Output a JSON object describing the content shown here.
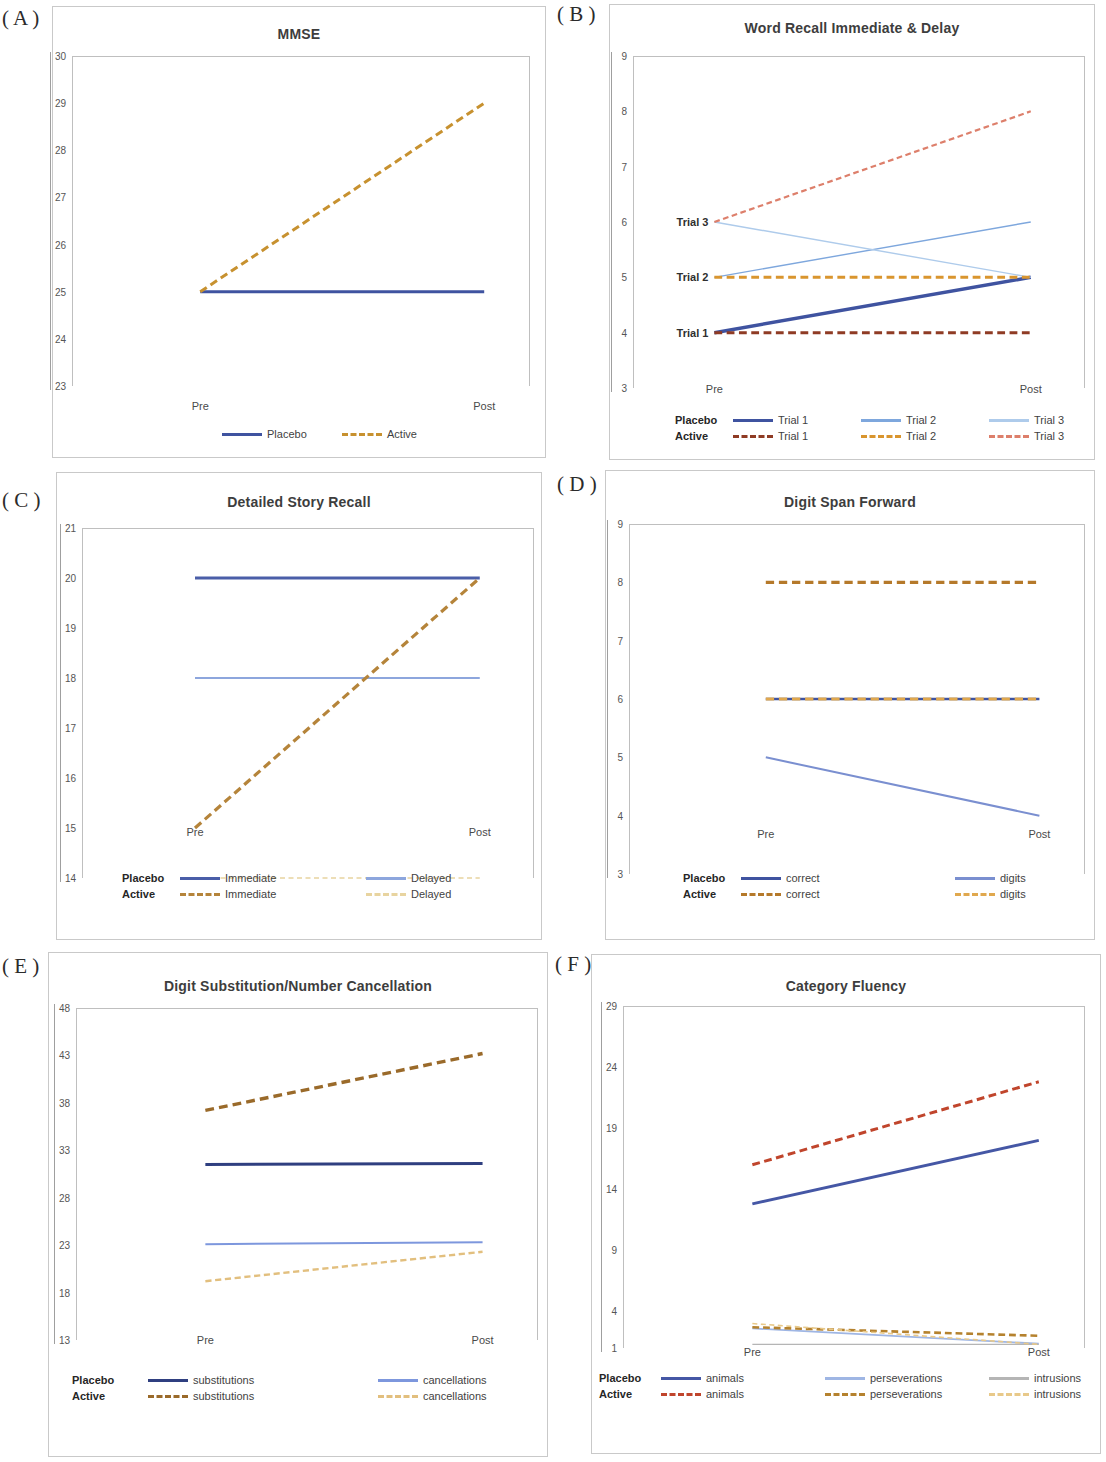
{
  "figure": {
    "panel_letters": [
      "( A )",
      "( B )",
      "( C )",
      "( D )",
      "( E )",
      "( F )"
    ],
    "x_categories": [
      "Pre",
      "Post"
    ],
    "group_labels": [
      "Placebo",
      "Active"
    ]
  },
  "colors": {
    "placebo_dark_blue": "#3f53a0",
    "placebo_mid_blue": "#6f8fd0",
    "placebo_light_blue": "#a9c4e8",
    "active_orange": "#c7912f",
    "active_dark_red": "#8f3b24",
    "active_light_orange": "#e0bb74",
    "active_red": "#c0452c",
    "frame_grey": "#c9c9c9",
    "axis_grey": "#9f9f9f"
  },
  "chart_data": [
    {
      "panel": "A",
      "type": "line",
      "title": "MMSE",
      "xlabel": "",
      "ylabel": "",
      "categories": [
        "Pre",
        "Post"
      ],
      "ylim": [
        23,
        30
      ],
      "yticks": [
        30,
        29,
        28,
        27,
        26,
        25,
        24,
        23
      ],
      "grid": false,
      "legend_position": "bottom",
      "series": [
        {
          "name": "Placebo",
          "group": "Placebo",
          "values": [
            25,
            25
          ],
          "color": "#3f53a0",
          "style": "solid",
          "width": 3
        },
        {
          "name": "Active",
          "group": "Active",
          "values": [
            25,
            29
          ],
          "color": "#c7912f",
          "style": "dashed",
          "width": 3
        }
      ],
      "legend": [
        {
          "group": "",
          "items": [
            {
              "label": "Placebo",
              "color": "#3f53a0",
              "style": "solid"
            },
            {
              "label": "Active",
              "color": "#c7912f",
              "style": "dashed"
            }
          ]
        }
      ]
    },
    {
      "panel": "B",
      "type": "line",
      "title": "Word Recall Immediate & Delay",
      "xlabel": "",
      "ylabel": "",
      "categories": [
        "Pre",
        "Post"
      ],
      "ylim": [
        3,
        9
      ],
      "yticks": [
        9,
        8,
        7,
        6,
        5,
        4,
        3
      ],
      "grid": false,
      "legend_position": "bottom",
      "annotations": [
        "Trial 3",
        "Trial 2",
        "Trial 1"
      ],
      "annotation_values": [
        6,
        5,
        4
      ],
      "series": [
        {
          "name": "Trial 1",
          "group": "Placebo",
          "values": [
            4,
            5
          ],
          "color": "#3f53a0",
          "style": "solid",
          "width": 3.5
        },
        {
          "name": "Trial 2",
          "group": "Placebo",
          "values": [
            5,
            6
          ],
          "color": "#7ea7dd",
          "style": "solid",
          "width": 1.4
        },
        {
          "name": "Trial 3",
          "group": "Placebo",
          "values": [
            6,
            5
          ],
          "color": "#aecbeb",
          "style": "solid",
          "width": 1.4
        },
        {
          "name": "Trial 1",
          "group": "Active",
          "values": [
            4,
            4
          ],
          "color": "#8f3b24",
          "style": "dashed",
          "width": 3
        },
        {
          "name": "Trial 2",
          "group": "Active",
          "values": [
            5,
            5
          ],
          "color": "#d9952e",
          "style": "dashed",
          "width": 3
        },
        {
          "name": "Trial 3",
          "group": "Active",
          "values": [
            6,
            8
          ],
          "color": "#dd7f6b",
          "style": "dashed",
          "width": 2.2
        }
      ],
      "legend": [
        {
          "group": "Placebo",
          "items": [
            {
              "label": "Trial 1",
              "color": "#3f53a0",
              "style": "solid"
            },
            {
              "label": "Trial 2",
              "color": "#7ea7dd",
              "style": "solid"
            },
            {
              "label": "Trial 3",
              "color": "#aecbeb",
              "style": "solid"
            }
          ]
        },
        {
          "group": "Active",
          "items": [
            {
              "label": "Trial 1",
              "color": "#8f3b24",
              "style": "dashed"
            },
            {
              "label": "Trial 2",
              "color": "#d9952e",
              "style": "dashed"
            },
            {
              "label": "Trial 3",
              "color": "#dd7f6b",
              "style": "dashed"
            }
          ]
        }
      ]
    },
    {
      "panel": "C",
      "type": "line",
      "title": "Detailed Story Recall",
      "xlabel": "",
      "ylabel": "",
      "categories": [
        "Pre",
        "Post"
      ],
      "ylim": [
        14,
        21
      ],
      "yticks": [
        21,
        20,
        19,
        18,
        17,
        16,
        15,
        14
      ],
      "grid": false,
      "legend_position": "bottom",
      "series": [
        {
          "name": "Immediate",
          "group": "Placebo",
          "values": [
            20,
            20
          ],
          "color": "#4a5ea8",
          "style": "solid",
          "width": 3.2
        },
        {
          "name": "Delayed",
          "group": "Placebo",
          "values": [
            18,
            18
          ],
          "color": "#8da6dd",
          "style": "solid",
          "width": 2
        },
        {
          "name": "Immediate",
          "group": "Active",
          "values": [
            15,
            20
          ],
          "color": "#b5843a",
          "style": "dashed",
          "width": 3.2
        },
        {
          "name": "Delayed",
          "group": "Active",
          "values": [
            14,
            14
          ],
          "color": "#e8d4a0",
          "style": "dashed",
          "width": 1.5
        }
      ],
      "legend": [
        {
          "group": "Placebo",
          "items": [
            {
              "label": "Immediate",
              "color": "#4a5ea8",
              "style": "solid"
            },
            {
              "label": "Delayed",
              "color": "#8da6dd",
              "style": "solid"
            }
          ]
        },
        {
          "group": "Active",
          "items": [
            {
              "label": "Immediate",
              "color": "#b5843a",
              "style": "dashed"
            },
            {
              "label": "Delayed",
              "color": "#e8d4a0",
              "style": "dashed"
            }
          ]
        }
      ]
    },
    {
      "panel": "D",
      "type": "line",
      "title": "Digit Span Forward",
      "xlabel": "",
      "ylabel": "",
      "categories": [
        "Pre",
        "Post"
      ],
      "ylim": [
        3,
        9
      ],
      "yticks": [
        9,
        8,
        7,
        6,
        5,
        4,
        3
      ],
      "grid": false,
      "legend_position": "bottom",
      "series": [
        {
          "name": "correct",
          "group": "Placebo",
          "values": [
            6,
            6
          ],
          "color": "#3f53a0",
          "style": "solid",
          "width": 2.6
        },
        {
          "name": "digits",
          "group": "Placebo",
          "values": [
            5,
            4
          ],
          "color": "#7a8fd0",
          "style": "solid",
          "width": 2
        },
        {
          "name": "correct",
          "group": "Active",
          "values": [
            8,
            8
          ],
          "color": "#b5792a",
          "style": "dashed",
          "width": 3.2
        },
        {
          "name": "digits",
          "group": "Active",
          "values": [
            6,
            6
          ],
          "color": "#e0a84e",
          "style": "dashed",
          "width": 3.2
        }
      ],
      "legend": [
        {
          "group": "Placebo",
          "items": [
            {
              "label": "correct",
              "color": "#3f53a0",
              "style": "solid"
            },
            {
              "label": "digits",
              "color": "#7a8fd0",
              "style": "solid"
            }
          ]
        },
        {
          "group": "Active",
          "items": [
            {
              "label": "correct",
              "color": "#b5792a",
              "style": "dashed"
            },
            {
              "label": "digits",
              "color": "#e0a84e",
              "style": "dashed"
            }
          ]
        }
      ]
    },
    {
      "panel": "E",
      "type": "line",
      "title": "Digit Substitution/Number Cancellation",
      "xlabel": "",
      "ylabel": "",
      "categories": [
        "Pre",
        "Post"
      ],
      "ylim": [
        13,
        48
      ],
      "yticks": [
        48,
        43,
        38,
        33,
        28,
        23,
        18,
        13
      ],
      "grid": false,
      "legend_position": "bottom",
      "series": [
        {
          "name": "substitutions",
          "group": "Placebo",
          "values": [
            31.5,
            31.6
          ],
          "color": "#2f3f80",
          "style": "solid",
          "width": 3
        },
        {
          "name": "cancellations",
          "group": "Placebo",
          "values": [
            23.1,
            23.3
          ],
          "color": "#7d97dd",
          "style": "solid",
          "width": 2
        },
        {
          "name": "substitutions",
          "group": "Active",
          "values": [
            37.2,
            43.2
          ],
          "color": "#9a6a2a",
          "style": "dashed",
          "width": 3.4
        },
        {
          "name": "cancellations",
          "group": "Active",
          "values": [
            19.2,
            22.3
          ],
          "color": "#e2bf7e",
          "style": "dashed",
          "width": 2.4
        }
      ],
      "legend": [
        {
          "group": "Placebo",
          "items": [
            {
              "label": "substitutions",
              "color": "#2f3f80",
              "style": "solid"
            },
            {
              "label": "cancellations",
              "color": "#7d97dd",
              "style": "solid"
            }
          ]
        },
        {
          "group": "Active",
          "items": [
            {
              "label": "substitutions",
              "color": "#9a6a2a",
              "style": "dashed"
            },
            {
              "label": "cancellations",
              "color": "#e2bf7e",
              "style": "dashed"
            }
          ]
        }
      ]
    },
    {
      "panel": "F",
      "type": "line",
      "title": "Category Fluency",
      "xlabel": "",
      "ylabel": "",
      "categories": [
        "Pre",
        "Post"
      ],
      "ylim": [
        1,
        29
      ],
      "yticks": [
        29,
        24,
        19,
        14,
        9,
        4,
        1
      ],
      "grid": false,
      "legend_position": "bottom",
      "series": [
        {
          "name": "animals",
          "group": "Placebo",
          "values": [
            12.8,
            18.0
          ],
          "color": "#4557a5",
          "style": "solid",
          "width": 3
        },
        {
          "name": "perseverations",
          "group": "Placebo",
          "values": [
            2.6,
            1.35
          ],
          "color": "#9fb6e4",
          "style": "solid",
          "width": 1.8
        },
        {
          "name": "intrusions",
          "group": "Placebo",
          "values": [
            1.3,
            1.3
          ],
          "color": "#b5b5b5",
          "style": "solid",
          "width": 1.2
        },
        {
          "name": "animals",
          "group": "Active",
          "values": [
            16.0,
            22.8
          ],
          "color": "#c0452c",
          "style": "dashed",
          "width": 3
        },
        {
          "name": "perseverations",
          "group": "Active",
          "values": [
            2.7,
            2.0
          ],
          "color": "#b5822e",
          "style": "dashed",
          "width": 2.6
        },
        {
          "name": "intrusions",
          "group": "Active",
          "values": [
            3.0,
            1.3
          ],
          "color": "#e8c98a",
          "style": "dashed",
          "width": 1.6
        }
      ],
      "legend": [
        {
          "group": "Placebo",
          "items": [
            {
              "label": "animals",
              "color": "#4557a5",
              "style": "solid"
            },
            {
              "label": "perseverations",
              "color": "#9fb6e4",
              "style": "solid"
            },
            {
              "label": "intrusions",
              "color": "#b5b5b5",
              "style": "solid"
            }
          ]
        },
        {
          "group": "Active",
          "items": [
            {
              "label": "animals",
              "color": "#c0452c",
              "style": "dashed"
            },
            {
              "label": "perseverations",
              "color": "#b5822e",
              "style": "dashed"
            },
            {
              "label": "intrusions",
              "color": "#e8c98a",
              "style": "dashed"
            }
          ]
        }
      ]
    }
  ]
}
